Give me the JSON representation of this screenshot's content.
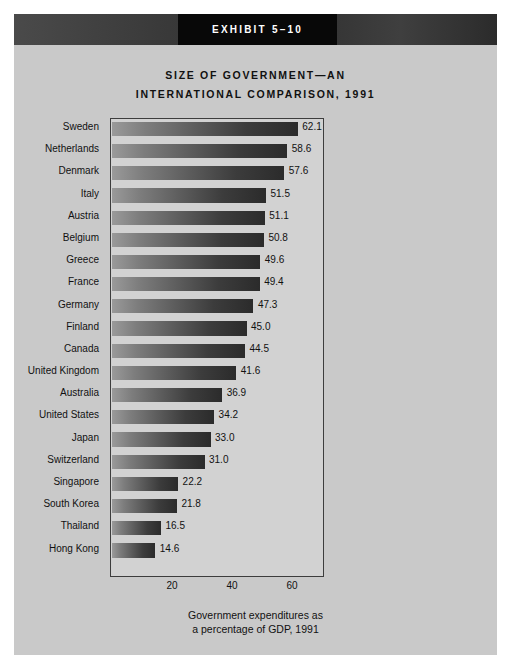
{
  "exhibit": {
    "banner_label": "EXHIBIT 5–10"
  },
  "title": {
    "line1": "SIZE OF GOVERNMENT—AN",
    "line2": "INTERNATIONAL COMPARISON, 1991"
  },
  "caption": {
    "line1": "Government expenditures as",
    "line2": "a percentage of GDP, 1991"
  },
  "colors": {
    "page_background": "#c9c9c9",
    "plot_background": "#d2d2d2",
    "banner_box": "#080808",
    "bar_light": "#9a9a9a",
    "bar_dark": "#2b2b2b",
    "text": "#111111",
    "plot_border": "#3d3d3d"
  },
  "chart_data": {
    "type": "bar",
    "orientation": "horizontal",
    "title": "SIZE OF GOVERNMENT—AN INTERNATIONAL COMPARISON, 1991",
    "xlabel": "Government expenditures as a percentage of GDP, 1991",
    "ylabel": "",
    "xlim": [
      0,
      70
    ],
    "xticks": [
      20,
      40,
      60
    ],
    "xtick_labels": [
      "20",
      "40",
      "60"
    ],
    "grid": false,
    "legend": false,
    "categories": [
      "Sweden",
      "Netherlands",
      "Denmark",
      "Italy",
      "Austria",
      "Belgium",
      "Greece",
      "France",
      "Germany",
      "Finland",
      "Canada",
      "United Kingdom",
      "Australia",
      "United States",
      "Japan",
      "Switzerland",
      "Singapore",
      "South Korea",
      "Thailand",
      "Hong Kong"
    ],
    "values": [
      62.1,
      58.6,
      57.6,
      51.5,
      51.1,
      50.8,
      49.6,
      49.4,
      47.3,
      45.0,
      44.5,
      41.6,
      36.9,
      34.2,
      33.0,
      31.0,
      22.2,
      21.8,
      16.5,
      14.6
    ],
    "value_labels": [
      "62.1",
      "58.6",
      "57.6",
      "51.5",
      "51.1",
      "50.8",
      "49.6",
      "49.4",
      "47.3",
      "45.0",
      "44.5",
      "41.6",
      "36.9",
      "34.2",
      "33.0",
      "31.0",
      "22.2",
      "21.8",
      "16.5",
      "14.6"
    ]
  }
}
